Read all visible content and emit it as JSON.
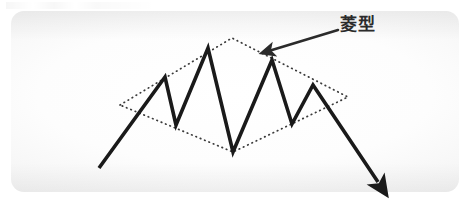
{
  "figure": {
    "title": "菱型",
    "annotation_label": "菱型",
    "pattern_name": "菱型",
    "background_color": "#ffffff",
    "panel_color": "#e6e6e6",
    "line_color": "#1a1a1a",
    "dotted_color": "#3a3a3a"
  },
  "chart_data": {
    "type": "line",
    "title": "菱型",
    "xlabel": "",
    "ylabel": "",
    "grid": false,
    "legend": null,
    "xlim": [
      90,
      390
    ],
    "ylim": [
      190,
      30
    ],
    "annotations": [
      {
        "text": "菱型",
        "x": 340,
        "y": 24,
        "arrow_from_x": 338,
        "arrow_from_y": 30,
        "arrow_to_x": 272,
        "arrow_to_y": 50
      }
    ],
    "series": [
      {
        "name": "price-zigzag",
        "points": [
          [
            99,
            168
          ],
          [
            165,
            77
          ],
          [
            176,
            125
          ],
          [
            208,
            48
          ],
          [
            233,
            152
          ],
          [
            272,
            60
          ],
          [
            292,
            124
          ],
          [
            313,
            85
          ],
          [
            378,
            182
          ]
        ]
      },
      {
        "name": "diamond-boundary",
        "style": "dotted",
        "points": [
          [
            120,
            105
          ],
          [
            232,
            38
          ],
          [
            348,
            97
          ],
          [
            233,
            152
          ],
          [
            120,
            105
          ]
        ]
      }
    ]
  },
  "diamond": {
    "left_vertex": {
      "x": 120,
      "y": 105
    },
    "top_vertex": {
      "x": 232,
      "y": 38
    },
    "right_vertex": {
      "x": 348,
      "y": 97
    },
    "bottom_vertex": {
      "x": 233,
      "y": 152
    }
  },
  "panel": {
    "left": 11,
    "top": 11,
    "width": 448,
    "height": 181,
    "corner_radius": 13
  }
}
